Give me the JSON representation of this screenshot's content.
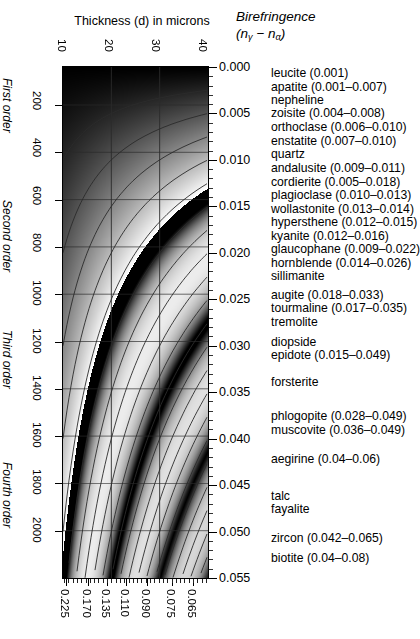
{
  "titles": {
    "thickness": "Thickness (d) in microns",
    "birefringence": "Birefringence",
    "birefringence_formula": "(nγ − nα)"
  },
  "axes": {
    "top_label_name": "thickness-microns",
    "top_ticks": [
      "10",
      "20",
      "30",
      "40"
    ],
    "left_ticks": [
      "200",
      "400",
      "600",
      "800",
      "1000",
      "1200",
      "1400",
      "1600",
      "1800",
      "2000"
    ],
    "right_ticks": [
      "0.000",
      "0.005",
      "0.010",
      "0.015",
      "0.020",
      "0.025",
      "0.030",
      "0.035",
      "0.040",
      "0.045",
      "0.050",
      "0.055"
    ],
    "bottom_ticks": [
      "0.225",
      "0.170",
      "0.135",
      "0.110",
      "0.090",
      "0.075",
      "0.065"
    ],
    "orders": [
      "First order",
      "Second order",
      "Third order",
      "Fourth order"
    ]
  },
  "minerals": [
    "leucite (0.001)",
    "apatite (0.001–0.007)",
    "nepheline",
    "zoisite (0.004–0.008)",
    "orthoclase (0.006–0.010)",
    "enstatite (0.007–0.010)",
    "quartz",
    "andalusite (0.009–0.011)",
    "cordierite (0.005–0.018)",
    "plagioclase (0.010–0.013)",
    "wollastonite (0.013–0.014)",
    "hypersthene (0.012–0.015)",
    "kyanite (0.012–0.016)",
    "glaucophane (0.009–0.022)",
    "hornblende (0.014–0.026)",
    "sillimanite",
    "augite (0.018–0.033)",
    "tourmaline (0.017–0.035)",
    "tremolite",
    "diopside",
    "epidote (0.015–0.049)",
    "forsterite",
    "phlogopite (0.028–0.049)",
    "muscovite (0.036–0.049)",
    "aegirine (0.04–0.06)",
    "talc",
    "fayalite",
    "zircon (0.042–0.065)",
    "biotite (0.04–0.08)"
  ],
  "chart_data": {
    "type": "heatmap",
    "xlabel": "Birefringence (nγ − nα)",
    "ylabel": "Thickness (d) in microns",
    "grid": true,
    "legend": "none",
    "x_top_axis": {
      "name": "thickness-microns",
      "ticks": [
        10,
        20,
        30,
        40
      ],
      "range": [
        10,
        40
      ]
    },
    "y_right_axis": {
      "name": "birefringence",
      "ticks": [
        0.0,
        0.005,
        0.01,
        0.015,
        0.02,
        0.025,
        0.03,
        0.035,
        0.04,
        0.045,
        0.05,
        0.055
      ],
      "range": [
        0.0,
        0.055
      ]
    },
    "y_left_axis": {
      "name": "retardation-thickness-nm",
      "ticks": [
        200,
        400,
        600,
        800,
        1000,
        1200,
        1400,
        1600,
        1800,
        2000
      ],
      "range": [
        0,
        2200
      ]
    },
    "x_bottom_axis": {
      "name": "birefringence-alt",
      "ticks": [
        0.225,
        0.17,
        0.135,
        0.11,
        0.09,
        0.075,
        0.065
      ]
    },
    "order_bands": [
      {
        "label": "First order",
        "y_center_fraction": 0.13
      },
      {
        "label": "Second order",
        "y_center_fraction": 0.37
      },
      {
        "label": "Third order",
        "y_center_fraction": 0.62
      },
      {
        "label": "Fourth order",
        "y_center_fraction": 0.86
      }
    ],
    "retardation_lines_count": 21,
    "mineral_labels": [
      {
        "name": "leucite",
        "min": 0.001,
        "max": 0.001
      },
      {
        "name": "apatite",
        "min": 0.001,
        "max": 0.007
      },
      {
        "name": "nepheline",
        "min": null,
        "max": null
      },
      {
        "name": "zoisite",
        "min": 0.004,
        "max": 0.008
      },
      {
        "name": "orthoclase",
        "min": 0.006,
        "max": 0.01
      },
      {
        "name": "enstatite",
        "min": 0.007,
        "max": 0.01
      },
      {
        "name": "quartz",
        "min": null,
        "max": null
      },
      {
        "name": "andalusite",
        "min": 0.009,
        "max": 0.011
      },
      {
        "name": "cordierite",
        "min": 0.005,
        "max": 0.018
      },
      {
        "name": "plagioclase",
        "min": 0.01,
        "max": 0.013
      },
      {
        "name": "wollastonite",
        "min": 0.013,
        "max": 0.014
      },
      {
        "name": "hypersthene",
        "min": 0.012,
        "max": 0.015
      },
      {
        "name": "kyanite",
        "min": 0.012,
        "max": 0.016
      },
      {
        "name": "glaucophane",
        "min": 0.009,
        "max": 0.022
      },
      {
        "name": "hornblende",
        "min": 0.014,
        "max": 0.026
      },
      {
        "name": "sillimanite",
        "min": null,
        "max": null
      },
      {
        "name": "augite",
        "min": 0.018,
        "max": 0.033
      },
      {
        "name": "tourmaline",
        "min": 0.017,
        "max": 0.035
      },
      {
        "name": "tremolite",
        "min": null,
        "max": null
      },
      {
        "name": "diopside",
        "min": null,
        "max": null
      },
      {
        "name": "epidote",
        "min": 0.015,
        "max": 0.049
      },
      {
        "name": "forsterite",
        "min": null,
        "max": null
      },
      {
        "name": "phlogopite",
        "min": 0.028,
        "max": 0.049
      },
      {
        "name": "muscovite",
        "min": 0.036,
        "max": 0.049
      },
      {
        "name": "aegirine",
        "min": 0.04,
        "max": 0.06
      },
      {
        "name": "talc",
        "min": null,
        "max": null
      },
      {
        "name": "fayalite",
        "min": null,
        "max": null
      },
      {
        "name": "zircon",
        "min": 0.042,
        "max": 0.065
      },
      {
        "name": "biotite",
        "min": 0.04,
        "max": 0.08
      }
    ]
  },
  "colors": {
    "background": "#ffffff",
    "text": "#000000",
    "axis": "#111111",
    "grid_line": "#2b2b2b"
  }
}
